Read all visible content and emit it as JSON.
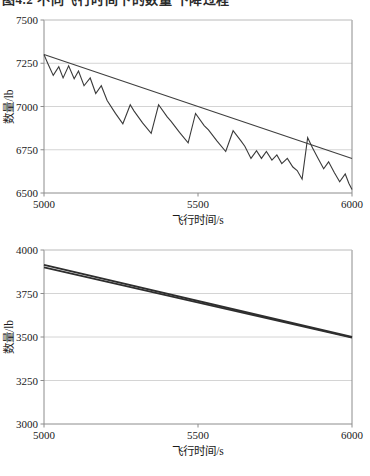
{
  "page": {
    "clipped_caption_top": "图4.2 不同飞行时间下的数量 下降过程"
  },
  "chart_data": [
    {
      "id": "chart-top",
      "type": "line",
      "title": "",
      "xlabel": "飞行时间/s",
      "ylabel": "数量/lb",
      "xlim": [
        5000,
        6000
      ],
      "ylim": [
        6500,
        7500
      ],
      "xticks": [
        5000,
        5500,
        6000
      ],
      "xticklabels": [
        "5000",
        "5500",
        "6000"
      ],
      "yticks": [
        6500,
        6750,
        7000,
        7250,
        7500
      ],
      "yticklabels": [
        "6500",
        "6750",
        "7000",
        "7250",
        "7500"
      ],
      "grid": "horizontal",
      "legend": "none",
      "series": [
        {
          "name": "sawtooth-fuel",
          "style": "solid",
          "color": "#3a3a3a",
          "x": [
            5000,
            5012,
            5030,
            5048,
            5062,
            5080,
            5098,
            5112,
            5130,
            5150,
            5168,
            5186,
            5205,
            5232,
            5256,
            5280,
            5292,
            5320,
            5348,
            5372,
            5400,
            5412,
            5440,
            5468,
            5492,
            5520,
            5534,
            5562,
            5590,
            5614,
            5640,
            5652,
            5672,
            5690,
            5706,
            5722,
            5740,
            5756,
            5772,
            5790,
            5808,
            5822,
            5838,
            5856,
            5872,
            5890,
            5908,
            5924,
            5942,
            5960,
            5978,
            5990,
            6000
          ],
          "y": [
            7300,
            7250,
            7180,
            7230,
            7165,
            7235,
            7160,
            7205,
            7120,
            7165,
            7075,
            7120,
            7035,
            6960,
            6900,
            7010,
            6975,
            6905,
            6845,
            7010,
            6940,
            6915,
            6850,
            6790,
            6960,
            6890,
            6865,
            6800,
            6740,
            6860,
            6800,
            6770,
            6700,
            6745,
            6700,
            6740,
            6690,
            6720,
            6670,
            6700,
            6650,
            6630,
            6580,
            6820,
            6760,
            6700,
            6640,
            6680,
            6620,
            6565,
            6610,
            6555,
            6520
          ]
        },
        {
          "name": "linear-trend",
          "style": "solid",
          "color": "#3f3f3f",
          "x": [
            5000,
            6000
          ],
          "y": [
            7300,
            6700
          ]
        }
      ]
    },
    {
      "id": "chart-bottom",
      "type": "line",
      "title": "",
      "xlabel": "飞行时间/s",
      "ylabel": "数量/lb",
      "xlim": [
        5000,
        6000
      ],
      "ylim": [
        3000,
        4000
      ],
      "xticks": [
        5000,
        5500,
        6000
      ],
      "xticklabels": [
        "5000",
        "5500",
        "6000"
      ],
      "yticks": [
        3000,
        3250,
        3500,
        3750,
        4000
      ],
      "yticklabels": [
        "3000",
        "3250",
        "3500",
        "3750",
        "4000"
      ],
      "grid": "horizontal",
      "legend": "none",
      "series": [
        {
          "name": "line-upper",
          "style": "solid",
          "color": "#2e2e2e",
          "x": [
            5000,
            6000
          ],
          "y": [
            3915,
            3500
          ]
        },
        {
          "name": "line-lower",
          "style": "solid",
          "color": "#2e2e2e",
          "x": [
            5000,
            6000
          ],
          "y": [
            3900,
            3497
          ]
        }
      ]
    }
  ]
}
